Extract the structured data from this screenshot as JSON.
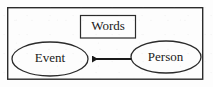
{
  "diagram": {
    "type": "entity-relationship-sketch",
    "frame": {
      "name": "outer-frame",
      "shape": "rectangle",
      "x": 7,
      "y": 7,
      "width": 196,
      "height": 72,
      "stroke": "#2b2b2b",
      "stroke_width": 1.4,
      "fill": "#fdfdfd"
    },
    "nodes": [
      {
        "id": "words",
        "label": "Words",
        "shape": "rectangle",
        "x": 80,
        "y": 15,
        "width": 56,
        "height": 23,
        "stroke": "#2b2b2b",
        "stroke_width": 1.2,
        "fill": "#fdfdfd"
      },
      {
        "id": "event",
        "label": "Event",
        "shape": "ellipse",
        "cx": 50,
        "cy": 59,
        "rx": 38,
        "ry": 17,
        "stroke": "#2b2b2b",
        "stroke_width": 1.3,
        "fill": "#fdfdfd"
      },
      {
        "id": "person",
        "label": "Person",
        "shape": "ellipse",
        "cx": 166,
        "cy": 57,
        "rx": 35,
        "ry": 16,
        "stroke": "#2b2b2b",
        "stroke_width": 1.3,
        "fill": "#fdfdfd"
      }
    ],
    "edges": [
      {
        "id": "person-to-event",
        "from": "person",
        "to": "event",
        "label": "",
        "direction": "left",
        "x1": 131,
        "y1": 59,
        "x2": 89,
        "y2": 59,
        "stroke": "#1a1a1a",
        "stroke_width": 2,
        "arrowhead": "filled-triangle"
      }
    ],
    "colors": {
      "stroke": "#2b2b2b",
      "arrow": "#1a1a1a",
      "background": "#fdfdfd",
      "text": "#1a1a1a"
    }
  }
}
